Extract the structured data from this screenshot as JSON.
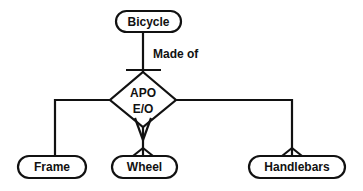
{
  "diagram": {
    "type": "entity-relationship",
    "stroke_color": "#111111",
    "background": "#ffffff",
    "parent": {
      "label": "Bicycle"
    },
    "relationship_label": "Made of",
    "connector": {
      "line1": "APO",
      "line2": "E/O"
    },
    "children": [
      {
        "label": "Frame"
      },
      {
        "label": "Wheel"
      },
      {
        "label": "Handlebars"
      }
    ]
  }
}
